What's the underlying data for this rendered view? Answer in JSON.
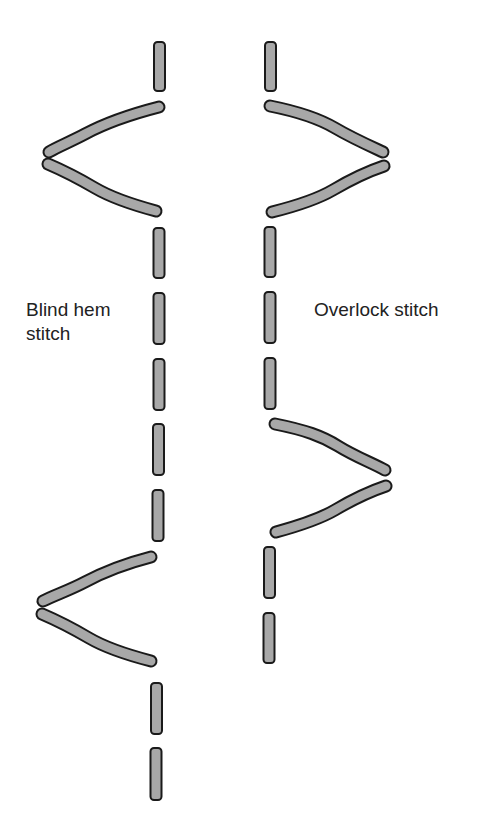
{
  "labels": {
    "left": "Blind hem stitch",
    "left_line1": "Blind hem",
    "left_line2": "stitch",
    "right": "Overlock stitch"
  },
  "colors": {
    "stitch_fill": "#a8a8a8",
    "stitch_stroke": "#1a1a1a",
    "background": "#ffffff",
    "text": "#222222"
  },
  "stitches": {
    "left": {
      "name": "blind-hem-stitch",
      "dashes": [
        {
          "x": 159.5,
          "y1": 42,
          "y2": 91
        },
        {
          "x": 159,
          "y1": 228,
          "y2": 278
        },
        {
          "x": 159,
          "y1": 293,
          "y2": 344
        },
        {
          "x": 159,
          "y1": 359,
          "y2": 410
        },
        {
          "x": 158.5,
          "y1": 424,
          "y2": 475
        },
        {
          "x": 158,
          "y1": 490,
          "y2": 541
        },
        {
          "x": 156.5,
          "y1": 683,
          "y2": 734
        },
        {
          "x": 156,
          "y1": 748,
          "y2": 800
        }
      ],
      "zigzags": [
        {
          "upper": "M159,107 C120,117 100,126 85,134 C70,142 57,147 49,152",
          "lower": "M48,164 C62,170 78,178 95,188 C112,198 130,204 156,211"
        },
        {
          "upper": "M151,557 C120,565 100,574 85,582 C70,590 55,595 43,601",
          "lower": "M42,614 C56,620 72,628 89,638 C106,648 128,655 151,661"
        }
      ]
    },
    "right": {
      "name": "overlock-stitch",
      "dashes": [
        {
          "x": 270.5,
          "y1": 42,
          "y2": 91
        },
        {
          "x": 270,
          "y1": 227,
          "y2": 277
        },
        {
          "x": 270,
          "y1": 292,
          "y2": 343
        },
        {
          "x": 270,
          "y1": 358,
          "y2": 409
        },
        {
          "x": 269.5,
          "y1": 547,
          "y2": 598
        },
        {
          "x": 269,
          "y1": 613,
          "y2": 663
        }
      ],
      "zigzags": [
        {
          "upper": "M270,106 C300,112 318,118 335,128 C352,138 370,146 383,152",
          "lower": "M384,166 C366,172 350,180 333,190 C316,200 296,206 272,212"
        },
        {
          "upper": "M275,424 C305,430 322,436 338,446 C354,456 372,463 385,470",
          "lower": "M386,486 C368,492 352,500 335,510 C318,520 298,526 276,532"
        }
      ]
    }
  }
}
